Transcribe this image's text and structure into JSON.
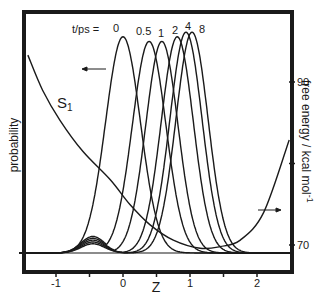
{
  "chart_data": {
    "type": "line",
    "title": "",
    "xlabel": "Z",
    "ylabel_left": "probability",
    "ylabel_right": "free energy / kcal mol-1",
    "ylabel_right_parts": {
      "main": "free energy / kcal mol",
      "sup": "-1"
    },
    "xlim": [
      -1.55,
      2.53
    ],
    "x_ticks": [
      -1,
      -0.5,
      0,
      0.5,
      1,
      1.5,
      2
    ],
    "x_tick_labels": [
      {
        "value": -1,
        "label": "-1"
      },
      {
        "value": 0,
        "label": "0"
      },
      {
        "value": 1,
        "label": "1"
      },
      {
        "value": 2,
        "label": "2"
      }
    ],
    "y_right_lim": [
      67.5,
      95.5
    ],
    "y_right_ticks": [
      70,
      80,
      90
    ],
    "y_right_tick_labels": [
      {
        "value": 70,
        "label": "70"
      },
      {
        "value": 90,
        "label": "90"
      }
    ],
    "legend_title": "t/ps =",
    "probability_series": [
      {
        "name": "0",
        "t_ps": 0,
        "center": 0.0,
        "height": 0.94,
        "width": 0.26
      },
      {
        "name": "0.5",
        "t_ps": 0.5,
        "center": 0.39,
        "height": 0.92,
        "width": 0.25
      },
      {
        "name": "1",
        "t_ps": 1,
        "center": 0.58,
        "height": 0.92,
        "width": 0.24
      },
      {
        "name": "2",
        "t_ps": 2,
        "center": 0.81,
        "height": 0.94,
        "width": 0.24
      },
      {
        "name": "4",
        "t_ps": 4,
        "center": 0.94,
        "height": 0.96,
        "width": 0.24
      },
      {
        "name": "8",
        "t_ps": 8,
        "center": 1.03,
        "height": 0.96,
        "width": 0.24
      }
    ],
    "free_energy_series": {
      "name": "S1",
      "label": "S",
      "label_sub": "1",
      "axis": "right",
      "z": [
        -1.42,
        -1.2,
        -0.94,
        -0.6,
        -0.19,
        0.1,
        0.4,
        0.75,
        1.15,
        1.45,
        1.75,
        2.1,
        2.48
      ],
      "energy": [
        93.3,
        89.0,
        85.3,
        81.5,
        78.0,
        75.0,
        72.5,
        70.6,
        69.6,
        69.8,
        70.6,
        74.0,
        82.9
      ]
    },
    "annotations": [
      {
        "type": "arrow",
        "direction": "left",
        "meaning": "probability curves use left axis"
      },
      {
        "type": "arrow",
        "direction": "right",
        "meaning": "free energy curve uses right axis"
      }
    ],
    "grid": false,
    "legend_position": "top, labels above each peak"
  }
}
